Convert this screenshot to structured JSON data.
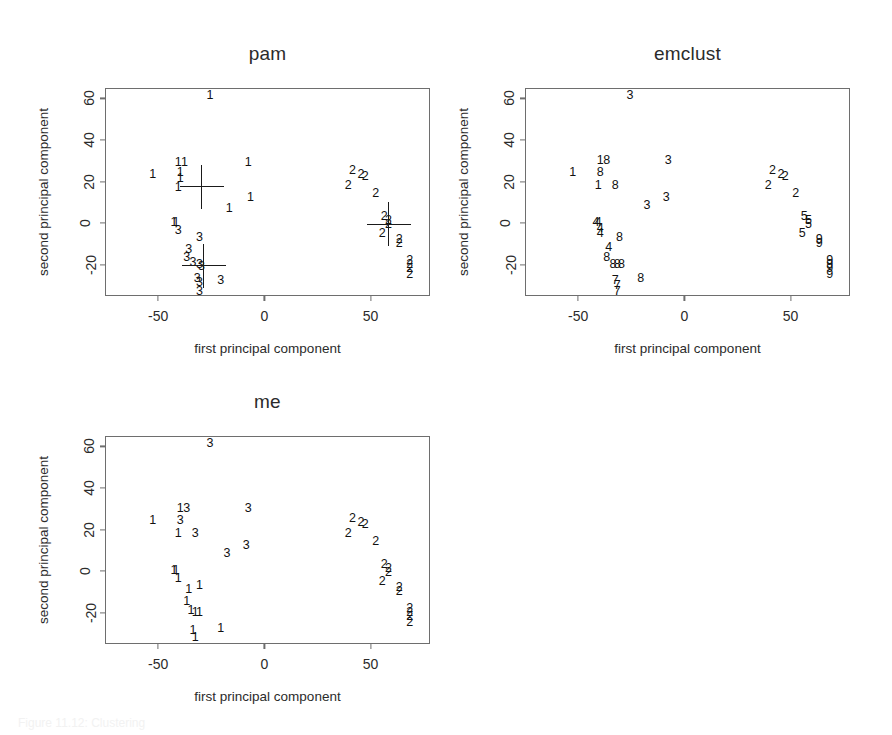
{
  "figure": {
    "caption_fragment": "Figure 11.12: Clustering",
    "xlabel": "first principal component",
    "ylabel": "second principal component",
    "xticks": [
      -50,
      0,
      50
    ],
    "yticks": [
      -20,
      0,
      20,
      40,
      60
    ],
    "xlim": [
      -75,
      78
    ],
    "ylim": [
      -35,
      65
    ]
  },
  "chart_data": [
    {
      "type": "scatter",
      "title": "pam",
      "xlabel": "first principal component",
      "ylabel": "second principal component",
      "xlim": [
        -75,
        78
      ],
      "ylim": [
        -35,
        65
      ],
      "xticks": [
        -50,
        0,
        50
      ],
      "yticks": [
        -20,
        0,
        20,
        40,
        60
      ],
      "grid": false,
      "legend": "none",
      "point_glyph": "cluster-number",
      "clusters": [
        1,
        2,
        3
      ],
      "medoid_markers": [
        {
          "x": -30,
          "y": 18
        },
        {
          "x": -29,
          "y": -20
        },
        {
          "x": 58,
          "y": 0
        }
      ],
      "points": [
        {
          "x": -26,
          "y": 62,
          "label": "1"
        },
        {
          "x": -41,
          "y": 30,
          "label": "1"
        },
        {
          "x": -38,
          "y": 30,
          "label": "1"
        },
        {
          "x": -53,
          "y": 24,
          "label": "1"
        },
        {
          "x": -40,
          "y": 25,
          "label": "1"
        },
        {
          "x": -40,
          "y": 22,
          "label": "1"
        },
        {
          "x": -41,
          "y": 18,
          "label": "1"
        },
        {
          "x": -8,
          "y": 30,
          "label": "1"
        },
        {
          "x": -17,
          "y": 8,
          "label": "1"
        },
        {
          "x": -7,
          "y": 13,
          "label": "1"
        },
        {
          "x": -43,
          "y": 1,
          "label": "1"
        },
        {
          "x": -42,
          "y": 1,
          "label": "1"
        },
        {
          "x": -41,
          "y": -3,
          "label": "3"
        },
        {
          "x": -31,
          "y": -6,
          "label": "3"
        },
        {
          "x": -36,
          "y": -12,
          "label": "3"
        },
        {
          "x": -37,
          "y": -16,
          "label": "3"
        },
        {
          "x": -34,
          "y": -18,
          "label": "3"
        },
        {
          "x": -31,
          "y": -19,
          "label": "3"
        },
        {
          "x": -30,
          "y": -20,
          "label": "3"
        },
        {
          "x": -32,
          "y": -26,
          "label": "3"
        },
        {
          "x": -31,
          "y": -28,
          "label": "3"
        },
        {
          "x": -31,
          "y": -32,
          "label": "3"
        },
        {
          "x": -21,
          "y": -27,
          "label": "3"
        },
        {
          "x": 41,
          "y": 26,
          "label": "2"
        },
        {
          "x": 45,
          "y": 24,
          "label": "2"
        },
        {
          "x": 47,
          "y": 23,
          "label": "2"
        },
        {
          "x": 39,
          "y": 19,
          "label": "2"
        },
        {
          "x": 52,
          "y": 15,
          "label": "2"
        },
        {
          "x": 56,
          "y": 4,
          "label": "2"
        },
        {
          "x": 58,
          "y": 2,
          "label": "2"
        },
        {
          "x": 58,
          "y": 0,
          "label": "2"
        },
        {
          "x": 55,
          "y": -4,
          "label": "2"
        },
        {
          "x": 63,
          "y": -7,
          "label": "2"
        },
        {
          "x": 63,
          "y": -9,
          "label": "2"
        },
        {
          "x": 68,
          "y": -17,
          "label": "2"
        },
        {
          "x": 68,
          "y": -19,
          "label": "2"
        },
        {
          "x": 68,
          "y": -21,
          "label": "2"
        },
        {
          "x": 68,
          "y": -24,
          "label": "2"
        }
      ]
    },
    {
      "type": "scatter",
      "title": "emclust",
      "xlabel": "first principal component",
      "ylabel": "second principal component",
      "xlim": [
        -75,
        78
      ],
      "ylim": [
        -35,
        65
      ],
      "xticks": [
        -50,
        0,
        50
      ],
      "yticks": [
        -20,
        0,
        20,
        40,
        60
      ],
      "grid": false,
      "legend": "none",
      "point_glyph": "cluster-number",
      "clusters": [
        1,
        2,
        3,
        4,
        5,
        7,
        8,
        9
      ],
      "medoid_markers": [],
      "points": [
        {
          "x": -26,
          "y": 62,
          "label": "3"
        },
        {
          "x": -40,
          "y": 31,
          "label": "1"
        },
        {
          "x": -37,
          "y": 31,
          "label": "8"
        },
        {
          "x": -53,
          "y": 25,
          "label": "1"
        },
        {
          "x": -40,
          "y": 25,
          "label": "8"
        },
        {
          "x": -41,
          "y": 19,
          "label": "1"
        },
        {
          "x": -33,
          "y": 19,
          "label": "8"
        },
        {
          "x": -8,
          "y": 31,
          "label": "3"
        },
        {
          "x": -9,
          "y": 13,
          "label": "3"
        },
        {
          "x": -18,
          "y": 9,
          "label": "3"
        },
        {
          "x": -42,
          "y": 1,
          "label": "4"
        },
        {
          "x": -41,
          "y": 1,
          "label": "4"
        },
        {
          "x": -40,
          "y": -2,
          "label": "4"
        },
        {
          "x": -40,
          "y": -4,
          "label": "4"
        },
        {
          "x": -31,
          "y": -6,
          "label": "8"
        },
        {
          "x": -36,
          "y": -11,
          "label": "4"
        },
        {
          "x": -37,
          "y": -16,
          "label": "8"
        },
        {
          "x": -34,
          "y": -19,
          "label": "8"
        },
        {
          "x": -32,
          "y": -19,
          "label": "8"
        },
        {
          "x": -30,
          "y": -19,
          "label": "8"
        },
        {
          "x": -21,
          "y": -26,
          "label": "8"
        },
        {
          "x": -33,
          "y": -27,
          "label": "7"
        },
        {
          "x": -32,
          "y": -29,
          "label": "7"
        },
        {
          "x": -32,
          "y": -32,
          "label": "7"
        },
        {
          "x": 41,
          "y": 26,
          "label": "2"
        },
        {
          "x": 45,
          "y": 24,
          "label": "2"
        },
        {
          "x": 47,
          "y": 23,
          "label": "2"
        },
        {
          "x": 39,
          "y": 19,
          "label": "2"
        },
        {
          "x": 52,
          "y": 15,
          "label": "2"
        },
        {
          "x": 56,
          "y": 4,
          "label": "5"
        },
        {
          "x": 58,
          "y": 2,
          "label": "5"
        },
        {
          "x": 58,
          "y": 0,
          "label": "5"
        },
        {
          "x": 55,
          "y": -4,
          "label": "5"
        },
        {
          "x": 63,
          "y": -7,
          "label": "9"
        },
        {
          "x": 63,
          "y": -9,
          "label": "9"
        },
        {
          "x": 68,
          "y": -17,
          "label": "9"
        },
        {
          "x": 68,
          "y": -19,
          "label": "9"
        },
        {
          "x": 68,
          "y": -21,
          "label": "9"
        },
        {
          "x": 68,
          "y": -24,
          "label": "9"
        }
      ]
    },
    {
      "type": "scatter",
      "title": "me",
      "xlabel": "first principal component",
      "ylabel": "second principal component",
      "xlim": [
        -75,
        78
      ],
      "ylim": [
        -35,
        65
      ],
      "xticks": [
        -50,
        0,
        50
      ],
      "yticks": [
        -20,
        0,
        20,
        40,
        60
      ],
      "grid": false,
      "legend": "none",
      "point_glyph": "cluster-number",
      "clusters": [
        1,
        2,
        3
      ],
      "medoid_markers": [],
      "points": [
        {
          "x": -26,
          "y": 62,
          "label": "3"
        },
        {
          "x": -40,
          "y": 31,
          "label": "1"
        },
        {
          "x": -37,
          "y": 31,
          "label": "3"
        },
        {
          "x": -53,
          "y": 25,
          "label": "1"
        },
        {
          "x": -40,
          "y": 25,
          "label": "3"
        },
        {
          "x": -41,
          "y": 19,
          "label": "1"
        },
        {
          "x": -33,
          "y": 19,
          "label": "3"
        },
        {
          "x": -8,
          "y": 31,
          "label": "3"
        },
        {
          "x": -9,
          "y": 13,
          "label": "3"
        },
        {
          "x": -18,
          "y": 9,
          "label": "3"
        },
        {
          "x": -43,
          "y": 1,
          "label": "1"
        },
        {
          "x": -42,
          "y": 1,
          "label": "1"
        },
        {
          "x": -41,
          "y": -3,
          "label": "1"
        },
        {
          "x": -36,
          "y": -8,
          "label": "1"
        },
        {
          "x": -31,
          "y": -6,
          "label": "1"
        },
        {
          "x": -37,
          "y": -14,
          "label": "1"
        },
        {
          "x": -35,
          "y": -18,
          "label": "1"
        },
        {
          "x": -33,
          "y": -19,
          "label": "1"
        },
        {
          "x": -31,
          "y": -19,
          "label": "1"
        },
        {
          "x": -34,
          "y": -28,
          "label": "1"
        },
        {
          "x": -33,
          "y": -31,
          "label": "1"
        },
        {
          "x": -21,
          "y": -27,
          "label": "1"
        },
        {
          "x": 41,
          "y": 26,
          "label": "2"
        },
        {
          "x": 45,
          "y": 24,
          "label": "2"
        },
        {
          "x": 47,
          "y": 23,
          "label": "2"
        },
        {
          "x": 39,
          "y": 19,
          "label": "2"
        },
        {
          "x": 52,
          "y": 15,
          "label": "2"
        },
        {
          "x": 56,
          "y": 4,
          "label": "2"
        },
        {
          "x": 58,
          "y": 2,
          "label": "2"
        },
        {
          "x": 58,
          "y": 0,
          "label": "2"
        },
        {
          "x": 55,
          "y": -4,
          "label": "2"
        },
        {
          "x": 63,
          "y": -7,
          "label": "2"
        },
        {
          "x": 63,
          "y": -9,
          "label": "2"
        },
        {
          "x": 68,
          "y": -17,
          "label": "2"
        },
        {
          "x": 68,
          "y": -19,
          "label": "2"
        },
        {
          "x": 68,
          "y": -21,
          "label": "2"
        },
        {
          "x": 68,
          "y": -24,
          "label": "2"
        }
      ]
    }
  ],
  "panels": [
    {
      "key": "pam",
      "left": 20,
      "top": 30,
      "box_left": 105,
      "box_top": 88,
      "box_w": 325,
      "box_h": 208
    },
    {
      "key": "emclust",
      "left": 455,
      "top": 30,
      "box_left": 525,
      "box_top": 88,
      "box_w": 325,
      "box_h": 208
    },
    {
      "key": "me",
      "left": 20,
      "top": 378,
      "box_left": 105,
      "box_top": 436,
      "box_w": 325,
      "box_h": 208
    }
  ]
}
